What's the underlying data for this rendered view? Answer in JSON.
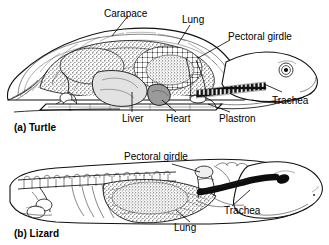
{
  "figure": {
    "background_color": "#ffffff",
    "ink_color": "#000000",
    "style": "black-and-white line and stipple engraving"
  },
  "panels": [
    {
      "id": "a",
      "caption": "(a) Turtle",
      "animal": "Turtle",
      "labels": [
        {
          "name": "carapace",
          "text": "Carapace"
        },
        {
          "name": "lung",
          "text": "Lung"
        },
        {
          "name": "pectoral-girdle",
          "text": "Pectoral girdle"
        },
        {
          "name": "trachea",
          "text": "Trachea"
        },
        {
          "name": "plastron",
          "text": "Plastron"
        },
        {
          "name": "heart",
          "text": "Heart"
        },
        {
          "name": "liver",
          "text": "Liver"
        }
      ]
    },
    {
      "id": "b",
      "caption": "(b) Lizard",
      "animal": "Lizard",
      "labels": [
        {
          "name": "pectoral-girdle",
          "text": "Pectoral girdle"
        },
        {
          "name": "trachea",
          "text": "Trachea"
        },
        {
          "name": "lung",
          "text": "Lung"
        }
      ]
    }
  ]
}
